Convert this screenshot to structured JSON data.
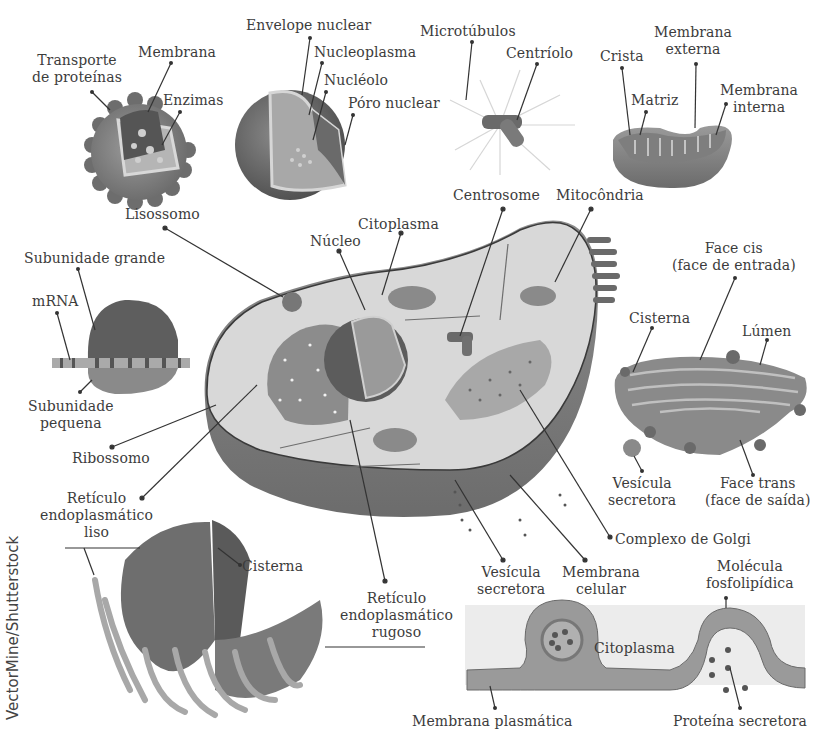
{
  "figure": {
    "title_cropped": "",
    "credit": "VectorMine/Shutterstock",
    "colors": {
      "background": "#ffffff",
      "ink": "#3c3c3c",
      "organelle_dark": "#6e6e6e",
      "organelle_mid": "#9a9a9a",
      "cytoplasm": "#d9d9d9",
      "membrane_fill": "#c8c8c8"
    }
  },
  "panels": {
    "lisossomo": {
      "title": "Lisossomo",
      "labels": [
        "Transporte",
        "de proteínas",
        "Membrana",
        "Enzimas"
      ]
    },
    "nucleo": {
      "labels": [
        "Envelope nuclear",
        "Nucleoplasma",
        "Nucléolo",
        "Póro nuclear"
      ]
    },
    "centrossomo": {
      "labels": [
        "Microtúbulos",
        "Centríolo"
      ]
    },
    "mitocondria": {
      "labels": [
        "Crista",
        "Membrana",
        "externa",
        "Matriz",
        "Membrana",
        "interna"
      ]
    },
    "ribossomo": {
      "title": "Ribossomo",
      "labels": [
        "Subunidade grande",
        "mRNA",
        "Subunidade",
        "pequena"
      ]
    },
    "celula": {
      "labels": [
        "Núcleo",
        "Citoplasma",
        "Centrosome",
        "Mitocôndria",
        "Complexo de Golgi",
        "Vesícula",
        "secretora",
        "Membrana",
        "celular",
        "Retículo",
        "endoplasmático",
        "rugoso"
      ]
    },
    "golgi": {
      "labels": [
        "Face cis",
        "(face de entrada)",
        "Cisterna",
        "Lúmen",
        "Vesícula",
        "secretora",
        "Face trans",
        "(face de saída)"
      ]
    },
    "reticulo": {
      "labels": [
        "Retículo",
        "endoplasmático",
        "liso",
        "Cisterna"
      ]
    },
    "membrana": {
      "labels": [
        "Molécula",
        "fosfolipídica",
        "Citoplasma",
        "Membrana plasmática",
        "Proteína secretora"
      ]
    }
  }
}
